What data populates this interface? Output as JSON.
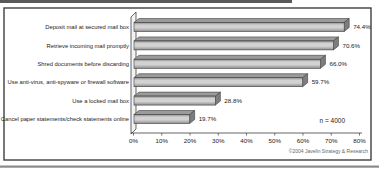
{
  "chart_data": {
    "type": "bar",
    "orientation": "horizontal",
    "style": "3d-grey-excel",
    "title": "",
    "xlabel": "",
    "ylabel": "",
    "categories": [
      "Deposit mail at secured mail box",
      "Retrieve incoming mail promptly",
      "Shred documents before discarding",
      "Use anti-virus, anti-spyware or firewall software",
      "Use a locked mail box",
      "Cancel paper statements/check statements online"
    ],
    "values": [
      74.4,
      70.6,
      66.0,
      59.7,
      28.8,
      19.7
    ],
    "value_labels": [
      "74.4%",
      "70.6%",
      "66.0%",
      "59.7%",
      "28.8%",
      "19.7%"
    ],
    "x_ticks": [
      "0%",
      "10%",
      "20%",
      "30%",
      "40%",
      "50%",
      "60%",
      "70%",
      "80%"
    ],
    "xlim": [
      0,
      80
    ],
    "grid": false,
    "legend": false,
    "sample_size_note": "n = 4000",
    "copyright_note": "©2004 Javelin Strategy & Research",
    "colors": {
      "bar_front_light": "#d2d2d2",
      "bar_front_dark": "#8d8d8d",
      "bar_top": "#9b9b9b",
      "bar_end": "#7d7d7d",
      "outline": "#3f3f3f",
      "wall_fill": "#f2f2f2",
      "frame_border": "#3f3f3f",
      "top_rule": "#58595b",
      "bottom_rule": "#8a8a8a",
      "text": "#1a1a1a",
      "copyright_text": "#666666"
    }
  }
}
